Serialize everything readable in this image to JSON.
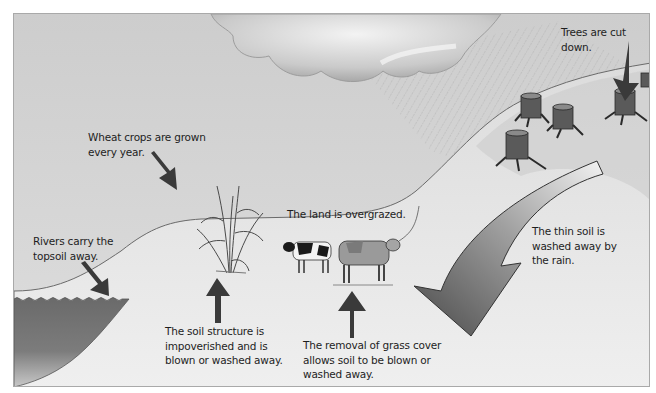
{
  "diagram": {
    "labels": {
      "trees_cut": "Trees are cut down.",
      "wheat": "Wheat crops are grown\nevery year.",
      "rivers": "Rivers carry the\ntopsoil away.",
      "overgrazed": "The land is overgrazed.",
      "thin_soil": "The thin soil is\nwashed away by\nthe rain.",
      "soil_structure": "The soil structure is\nimpoverished and is\nblown or washed away.",
      "grass_removal": "The removal of grass cover\nallows soil to be blown or\nwashed away."
    },
    "elements": {
      "cloud": "rain-cloud",
      "rain": "rain-lines",
      "stumps": [
        "tree-stump",
        "tree-stump",
        "tree-stump",
        "tree-stump",
        "tree-stump"
      ],
      "wheat": "wheat-plant",
      "cows": [
        "black-white-cow",
        "brown-cow"
      ],
      "river": "river-water",
      "big_arrow": "curved-erosion-arrow"
    },
    "colors": {
      "sky": "#d3d3d3",
      "ground": "#e6e6e6",
      "hill": "#cfcfcf",
      "water": "#6f6f6f",
      "arrow": "#3c3c3c",
      "text": "#1e1e1e"
    }
  }
}
